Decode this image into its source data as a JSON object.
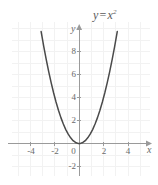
{
  "chart_data": {
    "type": "line",
    "title_parts": {
      "lhs": "y",
      "operator": "=",
      "base": "x",
      "exponent": "2"
    },
    "xlabel": "x",
    "ylabel": "y",
    "xlim": [
      -5.4,
      6.2
    ],
    "ylim": [
      -3.0,
      10.3
    ],
    "xticks": [
      -4,
      -2,
      0,
      2,
      4
    ],
    "xticklabels": [
      "-4",
      "-2",
      "0",
      "2",
      "4"
    ],
    "yticks": [
      -2,
      2,
      4,
      6,
      8
    ],
    "yticklabels": [
      "-2",
      "2",
      "4",
      "6",
      "8"
    ],
    "origin_label": "0",
    "grid": true,
    "grid_color": "#f2f2f2",
    "axis_color": "#9a9a9a",
    "curve_color": "#4a4a4a",
    "background": "#ffffff",
    "legend": null,
    "series": [
      {
        "name": "y = x²",
        "equation": "y = x^2",
        "domain": [
          -3.12,
          3.12
        ],
        "x": [
          -3.12,
          -2.9,
          -2.7,
          -2.5,
          -2.3,
          -2.1,
          -1.9,
          -1.7,
          -1.5,
          -1.3,
          -1.1,
          -0.9,
          -0.7,
          -0.5,
          -0.3,
          -0.1,
          0,
          0.1,
          0.3,
          0.5,
          0.7,
          0.9,
          1.1,
          1.3,
          1.5,
          1.7,
          1.9,
          2.1,
          2.3,
          2.5,
          2.7,
          2.9,
          3.12
        ],
        "y": [
          9.73,
          8.41,
          7.29,
          6.25,
          5.29,
          4.41,
          3.61,
          2.89,
          2.25,
          1.69,
          1.21,
          0.81,
          0.49,
          0.25,
          0.09,
          0.01,
          0,
          0.01,
          0.09,
          0.25,
          0.49,
          0.81,
          1.21,
          1.69,
          2.25,
          2.89,
          3.61,
          4.41,
          5.29,
          6.25,
          7.29,
          8.41,
          9.73
        ]
      }
    ],
    "vertex": {
      "x": 0,
      "y": 0
    }
  }
}
